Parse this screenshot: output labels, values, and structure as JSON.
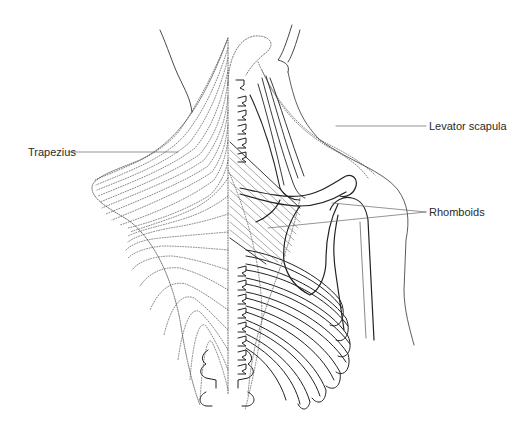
{
  "figure": {
    "labels": {
      "trapezius": "Trapezius",
      "levator_scapula": "Levator scapula",
      "rhomboids": "Rhomboids"
    },
    "colors": {
      "line": "#222222",
      "dotted": "#555555",
      "leader": "#666666",
      "background": "#ffffff"
    }
  }
}
